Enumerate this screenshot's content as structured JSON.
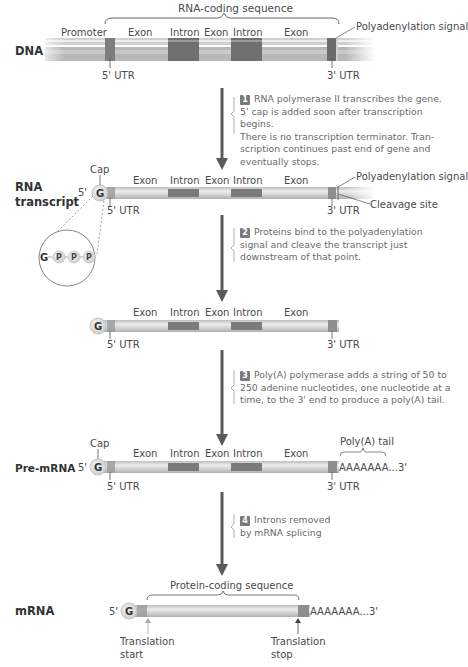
{
  "dna": {
    "label": "DNA",
    "brace_label": "RNA-coding sequence",
    "segments": [
      "Promoter",
      "Exon",
      "Intron",
      "Exon",
      "Intron",
      "Exon"
    ],
    "polyadenylation_signal": "Polyadenylation signal",
    "utr5": "5' UTR",
    "utr3": "3' UTR"
  },
  "step1": {
    "number": "1",
    "text": "RNA polymerase II transcribes the gene. 5' cap is added soon after transcription begins. There is no transcription terminator. Transcription continues past end of gene and eventually stops.",
    "lines": [
      "RNA polymerase II transcribes the gene.",
      "5' cap is added soon after transcription begins.",
      "There is no transcription terminator. Tran-",
      "scription continues past end of gene and",
      "eventually stops."
    ]
  },
  "rna_transcript": {
    "label_line1": "RNA",
    "label_line2": "transcript",
    "cap": "Cap",
    "five_prime": "5'",
    "g": "G",
    "segments": [
      "Exon",
      "Intron",
      "Exon",
      "Intron",
      "Exon"
    ],
    "polyadenylation_signal": "Polyadenylation signal",
    "cleavage_site": "Cleavage site",
    "utr5": "5' UTR",
    "utr3": "3' UTR",
    "cap_detail": [
      "G",
      "P",
      "P",
      "P"
    ]
  },
  "step2": {
    "number": "2",
    "lines": [
      "Proteins bind to the polyadenylation",
      "signal and cleave the transcript just",
      "downstream of that point."
    ]
  },
  "cleaved_transcript": {
    "g": "G",
    "segments": [
      "Exon",
      "Intron",
      "Exon",
      "Intron",
      "Exon"
    ],
    "utr5": "5' UTR",
    "utr3": "3' UTR"
  },
  "step3": {
    "number": "3",
    "lines": [
      "Poly(A) polymerase adds a string of 50 to",
      "250 adenine nucleotides, one nucleotide at a",
      "time, to the 3' end to produce a poly(A) tail."
    ]
  },
  "pre_mrna": {
    "label": "Pre-mRNA",
    "cap": "Cap",
    "five_prime": "5'",
    "g": "G",
    "segments": [
      "Exon",
      "Intron",
      "Exon",
      "Intron",
      "Exon"
    ],
    "polya_tail_label": "Poly(A) tail",
    "polya_seq": "AAAAAAA...3'",
    "utr5": "5' UTR",
    "utr3": "3' UTR"
  },
  "step4": {
    "number": "4",
    "lines": [
      "Introns removed",
      "by mRNA splicing"
    ]
  },
  "mrna": {
    "label": "mRNA",
    "five_prime": "5'",
    "g": "G",
    "brace_label": "Protein-coding sequence",
    "polya_seq": "AAAAAAA...3'",
    "translation_start_1": "Translation",
    "translation_start_2": "start",
    "translation_stop_1": "Translation",
    "translation_stop_2": "stop"
  },
  "colors": {
    "bar_light": "#d6d6d6",
    "bar_mid": "#b5b5b5",
    "bar_dark": "#6e6e6e",
    "arrow": "#5a5a5a",
    "text": "#4a4a4a"
  }
}
